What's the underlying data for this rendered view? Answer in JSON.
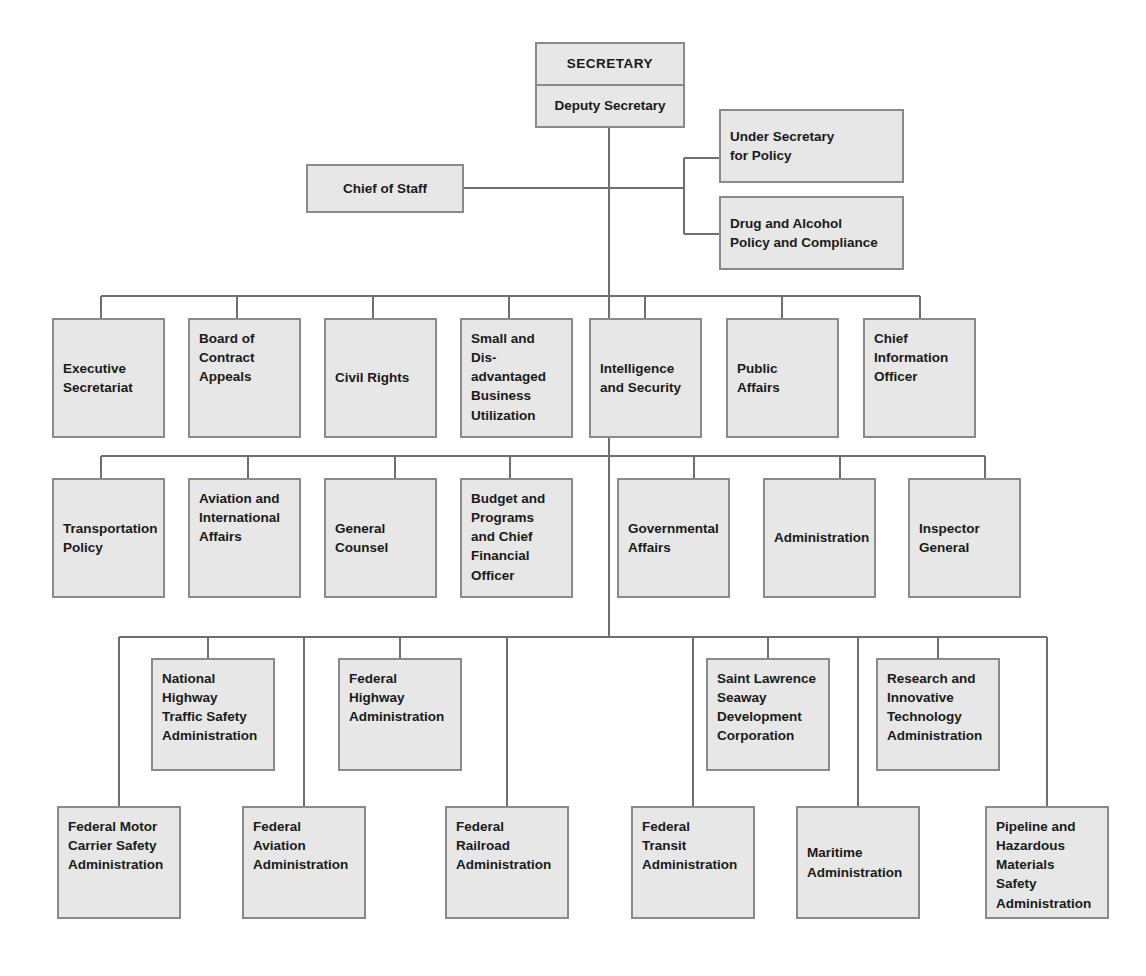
{
  "chart": {
    "box_fill": "#e7e7e7",
    "box_border": "#8a8a8a",
    "line_color": "#6e6e6e",
    "text_color": "#1a1a1a"
  },
  "head": {
    "secretary": "SECRETARY",
    "deputy_secretary": "Deputy Secretary",
    "chief_of_staff": "Chief of Staff"
  },
  "under_secretary_group": [
    {
      "label": "Under Secretary\nfor Policy"
    },
    {
      "label": "Drug and Alcohol\nPolicy and Compliance"
    }
  ],
  "row_staff_offices": [
    {
      "label": "Executive\nSecretariat"
    },
    {
      "label": "Board of\nContract\nAppeals"
    },
    {
      "label": "Civil Rights"
    },
    {
      "label": "Small and Dis-\nadvantaged\nBusiness\nUtilization"
    },
    {
      "label": "Intelligence\nand Security"
    },
    {
      "label": "Public\nAffairs"
    },
    {
      "label": "Chief\nInformation\nOfficer"
    }
  ],
  "row_assistant_secretaries": [
    {
      "label": "Transportation\nPolicy"
    },
    {
      "label": "Aviation and\nInternational\nAffairs"
    },
    {
      "label": "General\nCounsel"
    },
    {
      "label": "Budget and\nPrograms\nand Chief\nFinancial\nOfficer"
    },
    {
      "label": "Governmental\nAffairs"
    },
    {
      "label": "Administration"
    },
    {
      "label": "Inspector\nGeneral"
    }
  ],
  "row_operating_upper": [
    {
      "label": "National\nHighway\nTraffic Safety\nAdministration"
    },
    {
      "label": "Federal\nHighway\nAdministration"
    },
    {
      "label": "Saint Lawrence\nSeaway\nDevelopment\nCorporation"
    },
    {
      "label": "Research and\nInnovative\nTechnology\nAdministration"
    }
  ],
  "row_operating_lower": [
    {
      "label": "Federal Motor\nCarrier Safety\nAdministration"
    },
    {
      "label": "Federal\nAviation\nAdministration"
    },
    {
      "label": "Federal\nRailroad\nAdministration"
    },
    {
      "label": "Federal\nTransit\n Administration"
    },
    {
      "label": "Maritime\nAdministration"
    },
    {
      "label": "Pipeline and\nHazardous\nMaterials\nSafety\nAdministration"
    }
  ]
}
